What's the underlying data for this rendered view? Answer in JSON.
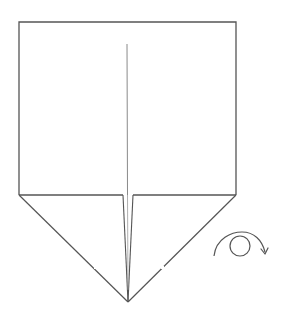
{
  "diagram": {
    "type": "origami-step",
    "colors": {
      "background": "#ffffff",
      "stroke": "#555555",
      "crease": "#8a8a8a"
    },
    "shapes": {
      "outline": {
        "top_left": [
          19,
          22
        ],
        "top_right": [
          236,
          22
        ],
        "bottom_right": [
          236,
          195
        ],
        "bottom_left": [
          19,
          195
        ],
        "apex": [
          128,
          302
        ]
      },
      "center_crease": {
        "from": [
          127,
          44
        ],
        "to": [
          127,
          195
        ]
      },
      "left_flap_edge": {
        "from": [
          123,
          195
        ],
        "to": [
          128,
          302
        ]
      },
      "right_flap_edge": {
        "from": [
          133,
          195
        ],
        "to": [
          128,
          302
        ]
      }
    },
    "symbols": [
      {
        "name": "turn-over-icon",
        "meaning": "Turn the paper over",
        "circle_center": [
          240,
          246
        ],
        "circle_radius": 10
      }
    ]
  }
}
